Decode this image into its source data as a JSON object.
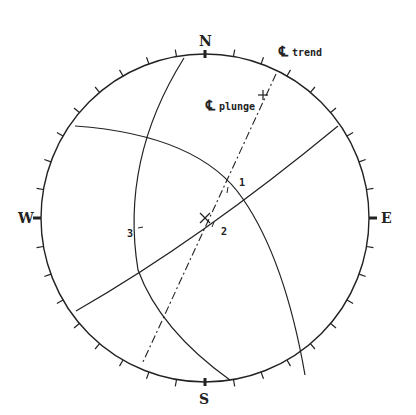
{
  "diagram": {
    "type": "stereonet",
    "directions": {
      "north": "N",
      "east": "E",
      "south": "S",
      "west": "W"
    },
    "labels": {
      "trend": "trend",
      "plunge": "plunge",
      "centerline_symbol": "℄",
      "plane_1": "1",
      "plane_2": "2",
      "plane_3": "3"
    },
    "colors": {
      "line": "#222222",
      "background": "#ffffff"
    }
  }
}
